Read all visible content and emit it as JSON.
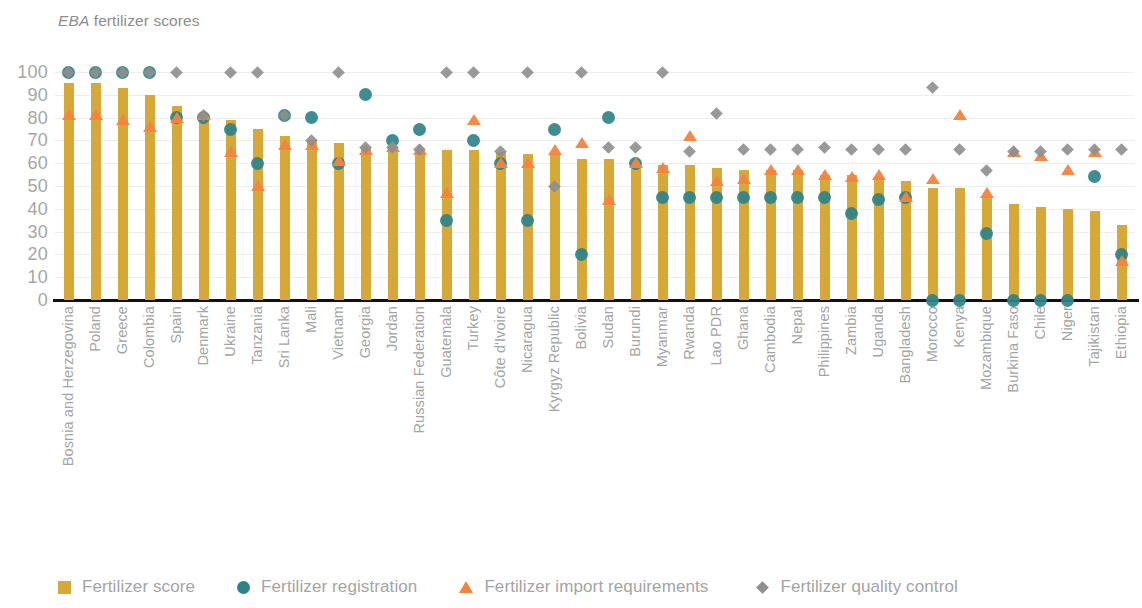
{
  "title": {
    "emphasis": "EBA",
    "rest": " fertilizer scores"
  },
  "legend": {
    "position": "bottom",
    "items": [
      {
        "label": "Fertilizer score",
        "symbol": "square",
        "color": "#D6A837"
      },
      {
        "label": "Fertilizer registration",
        "symbol": "circle",
        "color": "#2F8388"
      },
      {
        "label": "Fertilizer import requirements",
        "symbol": "triangle",
        "color": "#F4833F"
      },
      {
        "label": "Fertilizer quality control",
        "symbol": "diamond",
        "color": "#8E8E8E"
      }
    ]
  },
  "chart_data": {
    "type": "bar",
    "title": "EBA fertilizer scores",
    "xlabel": "",
    "ylabel": "",
    "ylim": [
      0,
      100
    ],
    "yticks": [
      100,
      90,
      80,
      70,
      60,
      50,
      40,
      30,
      20,
      10,
      0
    ],
    "grid": true,
    "categories": [
      "Bosnia and Herzegovina",
      "Poland",
      "Greece",
      "Colombia",
      "Spain",
      "Denmark",
      "Ukraine",
      "Tanzania",
      "Sri Lanka",
      "Mali",
      "Vietnam",
      "Georgia",
      "Jordan",
      "Russian Federation",
      "Guatemala",
      "Turkey",
      "Côte d'Ivoire",
      "Nicaragua",
      "Kyrgyz Republic",
      "Bolivia",
      "Sudan",
      "Burundi",
      "Myanmar",
      "Rwanda",
      "Lao PDR",
      "Ghana",
      "Cambodia",
      "Nepal",
      "Philippines",
      "Zambia",
      "Uganda",
      "Bangladesh",
      "Morocco",
      "Kenya",
      "Mozambique",
      "Burkina Faso",
      "Chile",
      "Niger",
      "Tajikistan",
      "Ethiopia"
    ],
    "series": [
      {
        "name": "Fertilizer score",
        "marker": "bar",
        "color": "#D6A837",
        "values": [
          95,
          95,
          93,
          90,
          85,
          81,
          79,
          75,
          72,
          70,
          69,
          67,
          67,
          66,
          66,
          66,
          65,
          64,
          64,
          62,
          62,
          60,
          59,
          59,
          58,
          57,
          57,
          57,
          55,
          55,
          54,
          52,
          49,
          49,
          45,
          42,
          41,
          40,
          39,
          33
        ]
      },
      {
        "name": "Fertilizer registration",
        "marker": "circle",
        "color": "#2F8388",
        "values": [
          100,
          100,
          100,
          100,
          80,
          80,
          75,
          60,
          81,
          80,
          60,
          90,
          70,
          75,
          35,
          70,
          60,
          35,
          75,
          20,
          80,
          60,
          45,
          45,
          45,
          45,
          45,
          45,
          45,
          38,
          44,
          45,
          0,
          0,
          29,
          0,
          0,
          0,
          54,
          20
        ]
      },
      {
        "name": "Fertilizer import requirements",
        "marker": "triangle",
        "color": "#F4833F",
        "values": [
          81,
          81,
          79,
          76,
          80,
          81,
          65,
          50,
          68,
          68,
          61,
          66,
          67,
          66,
          47,
          79,
          60,
          60,
          66,
          69,
          44,
          60,
          58,
          72,
          52,
          53,
          57,
          57,
          55,
          54,
          55,
          45,
          53,
          81,
          47,
          65,
          63,
          57,
          65,
          17
        ]
      },
      {
        "name": "Fertilizer quality control",
        "marker": "diamond",
        "color": "#8E8E8E",
        "values": [
          100,
          100,
          100,
          100,
          100,
          81,
          100,
          100,
          81,
          70,
          100,
          67,
          67,
          66,
          100,
          100,
          65,
          100,
          50,
          100,
          67,
          67,
          100,
          65,
          82,
          66,
          66,
          66,
          67,
          66,
          66,
          66,
          93,
          66,
          57,
          65,
          65,
          66,
          66,
          66
        ]
      }
    ]
  }
}
